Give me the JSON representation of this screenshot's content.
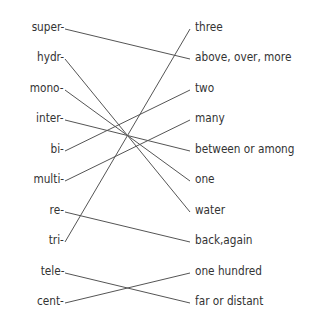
{
  "prefixes": [
    "super-",
    "hydr-",
    "mono-",
    "inter-",
    "bi-",
    "multi-",
    "re-",
    "tri-",
    "tele-",
    "cent-"
  ],
  "meanings": [
    "three",
    "above, over, more",
    "two",
    "many",
    "between or among",
    "one",
    "water",
    "back,again",
    "one hundred",
    "far or distant"
  ],
  "connections": [
    {
      "prefix": "super-",
      "meaning": "above, over, more"
    },
    {
      "prefix": "hydr-",
      "meaning": "water"
    },
    {
      "prefix": "mono-",
      "meaning": "one"
    },
    {
      "prefix": "inter-",
      "meaning": "between or among"
    },
    {
      "prefix": "bi-",
      "meaning": "two"
    },
    {
      "prefix": "multi-",
      "meaning": "many"
    },
    {
      "prefix": "re-",
      "meaning": "back,again"
    },
    {
      "prefix": "tri-",
      "meaning": "three"
    },
    {
      "prefix": "tele-",
      "meaning": "far or distant"
    },
    {
      "prefix": "cent-",
      "meaning": "one hundred"
    }
  ],
  "line_color": "#555555"
}
